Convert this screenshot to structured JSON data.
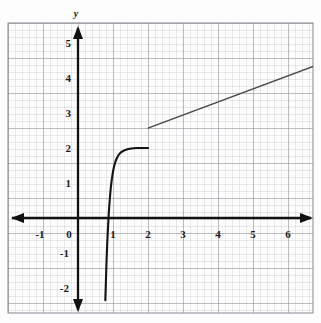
{
  "figure": {
    "background_color": "#fdfdfd",
    "grid": {
      "show": true,
      "minor_color": "#c9c9cf",
      "major_color": "#8d8d97",
      "minor_step_units": 0.2,
      "major_step_units": 1
    },
    "axis_color": "#111111",
    "curve_color": "#141414",
    "line_color": "#444444"
  },
  "chart_data": {
    "type": "line",
    "title": "",
    "subtitle": "",
    "xlabel": "",
    "ylabel": "y",
    "x_axis_name": "",
    "y_axis_name": "y",
    "xlim": [
      -1.9,
      6.8
    ],
    "ylim": [
      -2.35,
      5.4
    ],
    "xticks": [
      -1,
      0,
      1,
      2,
      3,
      4,
      5,
      6
    ],
    "xtick_labels": [
      "-1",
      "0",
      "1",
      "2",
      "3",
      "4",
      "5",
      "6"
    ],
    "yticks": [
      -2,
      -1,
      1,
      2,
      3,
      4,
      5
    ],
    "ytick_labels": [
      "-2",
      "-1",
      "1",
      "2",
      "3",
      "4",
      "5"
    ],
    "grid": true,
    "legend": "none",
    "series": [
      {
        "name": "curve-branch",
        "type": "curve",
        "style": "solid",
        "width": 2.1,
        "color": "#141414",
        "domain": [
          0.78,
          2.0
        ],
        "endpoint_open_left": false,
        "endpoint_right_value": 2.0,
        "points": [
          [
            0.78,
            -2.35
          ],
          [
            0.79,
            -2.05
          ],
          [
            0.8,
            -1.72
          ],
          [
            0.812,
            -1.34
          ],
          [
            0.826,
            -0.96
          ],
          [
            0.842,
            -0.58
          ],
          [
            0.86,
            -0.22
          ],
          [
            0.88,
            0.14
          ],
          [
            0.905,
            0.5
          ],
          [
            0.935,
            0.84
          ],
          [
            0.97,
            1.13
          ],
          [
            1.01,
            1.38
          ],
          [
            1.06,
            1.58
          ],
          [
            1.12,
            1.73
          ],
          [
            1.19,
            1.84
          ],
          [
            1.28,
            1.91
          ],
          [
            1.39,
            1.96
          ],
          [
            1.52,
            1.985
          ],
          [
            1.68,
            1.998
          ],
          [
            1.85,
            2.0
          ],
          [
            2.0,
            2.0
          ]
        ]
      },
      {
        "name": "line-branch",
        "type": "line",
        "style": "solid",
        "width": 1.3,
        "color": "#444444",
        "x": [
          2.0,
          6.72
        ],
        "y": [
          2.57,
          4.33
        ],
        "slope": 0.373,
        "intercept": 1.824,
        "start_point": [
          2.0,
          2.57
        ],
        "end_point": [
          6.72,
          4.33
        ]
      }
    ],
    "annotations": []
  },
  "axes": {
    "x_arrow_left": true,
    "x_arrow_right": true,
    "y_arrow_up": true,
    "y_arrow_down": true
  }
}
